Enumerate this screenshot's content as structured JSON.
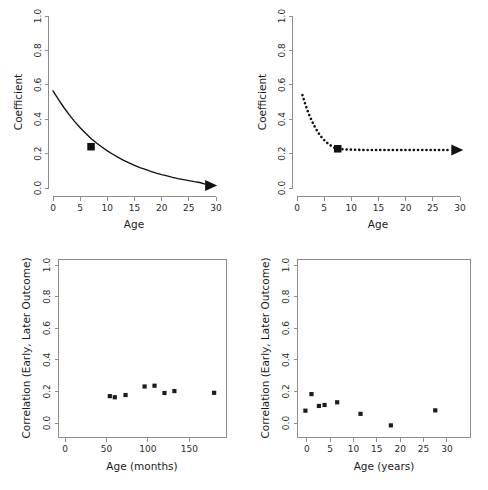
{
  "figure": {
    "title": "",
    "panel_count": 4,
    "background": "#ffffff",
    "foreground": "#111111",
    "axis_color": "#8d8d8d"
  },
  "chart_data": [
    {
      "id": "top-left",
      "type": "line",
      "title": "",
      "xlabel": "Age",
      "ylabel": "Coefficient",
      "xlim": [
        0,
        30
      ],
      "ylim": [
        0,
        1.0
      ],
      "xticks": [
        0,
        5,
        10,
        15,
        20,
        25,
        30
      ],
      "xticklabels": [
        "0",
        "5",
        "10",
        "15",
        "20",
        "25",
        "30"
      ],
      "yticks": [
        0.0,
        0.2,
        0.4,
        0.6,
        0.8,
        1.0
      ],
      "yticklabels": [
        "0.0",
        "0.2",
        "0.4",
        "0.6",
        "0.8",
        "1.0"
      ],
      "grid": false,
      "legend": "none",
      "frame": "left-bottom-axes",
      "linestyle": "solid",
      "x": [
        0,
        1,
        2,
        3,
        4,
        5,
        6,
        7,
        8,
        9,
        10,
        11,
        12,
        13,
        14,
        15,
        16,
        17,
        18,
        19,
        20,
        21,
        22,
        23,
        24,
        25,
        26,
        27,
        28
      ],
      "y": [
        0.565,
        0.515,
        0.468,
        0.425,
        0.386,
        0.35,
        0.318,
        0.288,
        0.262,
        0.238,
        0.216,
        0.196,
        0.178,
        0.161,
        0.146,
        0.132,
        0.119,
        0.108,
        0.097,
        0.087,
        0.078,
        0.07,
        0.062,
        0.055,
        0.049,
        0.043,
        0.037,
        0.032,
        0.022
      ],
      "markers": [
        {
          "x": 7,
          "y": 0.24,
          "shape": "square"
        }
      ],
      "arrow": {
        "at_x": 28,
        "at_y": 0.015,
        "direction": "right"
      }
    },
    {
      "id": "top-right",
      "type": "line",
      "title": "",
      "xlabel": "Age",
      "ylabel": "Coefficient",
      "xlim": [
        0,
        30
      ],
      "ylim": [
        0,
        1.0
      ],
      "xticks": [
        0,
        5,
        10,
        15,
        20,
        25,
        30
      ],
      "xticklabels": [
        "0",
        "5",
        "10",
        "15",
        "20",
        "25",
        "30"
      ],
      "yticks": [
        0.0,
        0.2,
        0.4,
        0.6,
        0.8,
        1.0
      ],
      "yticklabels": [
        "0.0",
        "0.2",
        "0.4",
        "0.6",
        "0.8",
        "1.0"
      ],
      "grid": false,
      "legend": "none",
      "frame": "left-bottom-axes",
      "linestyle": "dotted",
      "x": [
        1.0,
        1.6,
        2.2,
        2.8,
        3.4,
        4.0,
        4.6,
        5.2,
        5.8,
        6.4,
        7.0,
        7.5,
        9,
        11,
        13,
        15,
        17,
        19,
        21,
        23,
        25,
        27,
        28.2
      ],
      "y": [
        0.54,
        0.48,
        0.428,
        0.385,
        0.348,
        0.318,
        0.292,
        0.272,
        0.256,
        0.243,
        0.233,
        0.228,
        0.224,
        0.222,
        0.221,
        0.221,
        0.221,
        0.221,
        0.221,
        0.221,
        0.221,
        0.221,
        0.221
      ],
      "markers": [
        {
          "x": 7.5,
          "y": 0.228,
          "shape": "square"
        }
      ],
      "arrow": {
        "at_x": 28.4,
        "at_y": 0.221,
        "direction": "right"
      }
    },
    {
      "id": "bottom-left",
      "type": "scatter",
      "title": "",
      "xlabel": "Age (months)",
      "ylabel": "Correlation (Early, Later Outcome)",
      "xlim": [
        -8,
        195
      ],
      "ylim": [
        -0.04,
        1.05
      ],
      "xticks": [
        0,
        50,
        100,
        150
      ],
      "xticklabels": [
        "0",
        "50",
        "100",
        "150"
      ],
      "yticks": [
        0.0,
        0.2,
        0.4,
        0.6,
        0.8,
        1.0
      ],
      "yticklabels": [
        "0.0",
        "0.2",
        "0.4",
        "0.6",
        "0.8",
        "1.0"
      ],
      "grid": false,
      "legend": "none",
      "frame": "box",
      "marker": "square",
      "points": [
        {
          "x": 54,
          "y": 0.17
        },
        {
          "x": 60,
          "y": 0.163
        },
        {
          "x": 73,
          "y": 0.177
        },
        {
          "x": 96,
          "y": 0.231
        },
        {
          "x": 108,
          "y": 0.236
        },
        {
          "x": 120,
          "y": 0.19
        },
        {
          "x": 132,
          "y": 0.202
        },
        {
          "x": 180,
          "y": 0.191
        }
      ]
    },
    {
      "id": "bottom-right",
      "type": "scatter",
      "title": "",
      "xlabel": "Age (years)",
      "ylabel": "Correlation (Early, Later Outcome)",
      "xlim": [
        -2,
        35
      ],
      "ylim": [
        -0.06,
        1.05
      ],
      "xticks": [
        0,
        5,
        10,
        15,
        20,
        25,
        30
      ],
      "xticklabels": [
        "0",
        "5",
        "10",
        "15",
        "20",
        "25",
        "30"
      ],
      "yticks": [
        0.0,
        0.2,
        0.4,
        0.6,
        0.8,
        1.0
      ],
      "yticklabels": [
        "0.0",
        "0.2",
        "0.4",
        "0.6",
        "0.8",
        "1.0"
      ],
      "grid": false,
      "legend": "none",
      "frame": "box",
      "marker": "square",
      "points": [
        {
          "x": -0.3,
          "y": 0.078
        },
        {
          "x": 1.0,
          "y": 0.183
        },
        {
          "x": 2.6,
          "y": 0.108
        },
        {
          "x": 3.8,
          "y": 0.114
        },
        {
          "x": 6.5,
          "y": 0.131
        },
        {
          "x": 11.5,
          "y": 0.058
        },
        {
          "x": 18.0,
          "y": -0.015
        },
        {
          "x": 27.5,
          "y": 0.08
        }
      ]
    }
  ]
}
